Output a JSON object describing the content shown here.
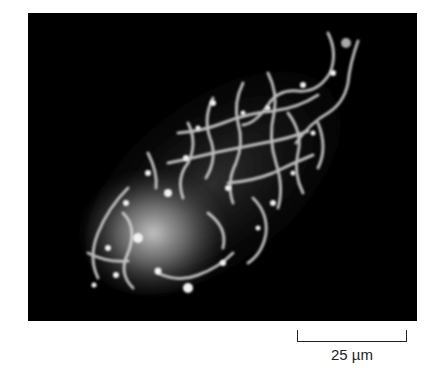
{
  "figure": {
    "scale_bar": {
      "label": "25 µm",
      "color": "#222222"
    },
    "colors": {
      "background": "#000000",
      "signal": "#e6e6e6",
      "page": "#ffffff"
    }
  }
}
